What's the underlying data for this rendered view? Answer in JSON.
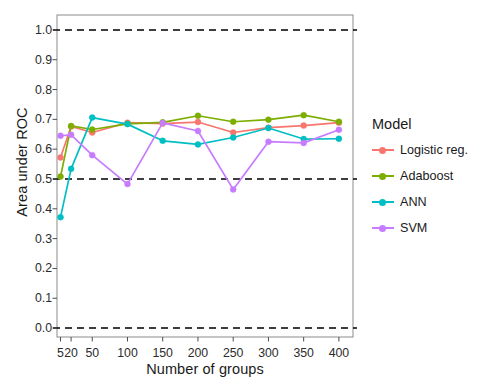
{
  "chart_data": {
    "type": "line",
    "title": "",
    "xlabel": "Number of groups",
    "ylabel": "Area under ROC",
    "x": [
      5,
      20,
      50,
      100,
      150,
      200,
      250,
      300,
      350,
      400
    ],
    "xticklabels": [
      "5",
      "20",
      "50",
      "100",
      "150",
      "200",
      "250",
      "300",
      "350",
      "400"
    ],
    "xlim": [
      0,
      420
    ],
    "ylim": [
      -0.03,
      1.05
    ],
    "yticks": [
      0.0,
      0.1,
      0.2,
      0.3,
      0.4,
      0.5,
      0.6,
      0.7,
      0.8,
      0.9,
      1.0
    ],
    "yticklabels": [
      "0.0",
      "0.1",
      "0.2",
      "0.3",
      "0.4",
      "0.5",
      "0.6",
      "0.7",
      "0.8",
      "0.9",
      "1.0"
    ],
    "grid": false,
    "reference_lines": [
      {
        "y": 1.0,
        "style": "dashed",
        "color": "#000000"
      },
      {
        "y": 0.5,
        "style": "dashed",
        "color": "#000000"
      },
      {
        "y": 0.0,
        "style": "dashed",
        "color": "#000000"
      }
    ],
    "legend": {
      "title": "Model",
      "position": "right",
      "entries": [
        "Logistic reg.",
        "Adaboost",
        "ANN",
        "SVM"
      ]
    },
    "series": [
      {
        "name": "Logistic reg.",
        "color": "#F8766D",
        "values": [
          0.572,
          0.676,
          0.656,
          0.689,
          0.686,
          0.691,
          0.656,
          0.672,
          0.679,
          0.689
        ]
      },
      {
        "name": "Adaboost",
        "color": "#7CAE00",
        "values": [
          0.508,
          0.678,
          0.666,
          0.685,
          0.69,
          0.712,
          0.692,
          0.699,
          0.714,
          0.692
        ]
      },
      {
        "name": "ANN",
        "color": "#00BFC4",
        "values": [
          0.372,
          0.534,
          0.706,
          0.684,
          0.628,
          0.616,
          0.639,
          0.671,
          0.634,
          0.635
        ]
      },
      {
        "name": "SVM",
        "color": "#C77CFF",
        "values": [
          0.645,
          0.648,
          0.58,
          0.483,
          0.688,
          0.661,
          0.465,
          0.625,
          0.621,
          0.665
        ]
      }
    ]
  },
  "axes": {
    "y_title": "Area under ROC",
    "x_title": "Number of groups"
  },
  "legend": {
    "title": "Model",
    "items": [
      {
        "label": "Logistic reg.",
        "color": "#F8766D"
      },
      {
        "label": "Adaboost",
        "color": "#7CAE00"
      },
      {
        "label": "ANN",
        "color": "#00BFC4"
      },
      {
        "label": "SVM",
        "color": "#C77CFF"
      }
    ]
  }
}
